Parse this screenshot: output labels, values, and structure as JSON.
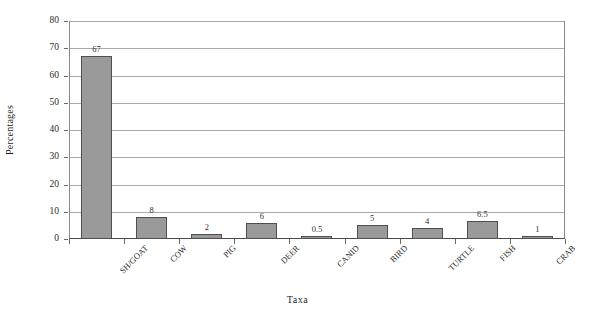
{
  "chart_data": {
    "type": "bar",
    "title": "",
    "xlabel": "Taxa",
    "ylabel": "Percentages",
    "categories": [
      "SH/GOAT",
      "COW",
      "PIG",
      "DEER",
      "CANID",
      "BIRD",
      "TURTLE",
      "FISH",
      "CRAB"
    ],
    "values": [
      67,
      8,
      2,
      6,
      0.5,
      5,
      4,
      6.5,
      1
    ],
    "value_labels": [
      "67",
      "8",
      "2",
      "6",
      "0.5",
      "5",
      "4",
      "6.5",
      "1"
    ],
    "ylim": [
      0,
      80
    ],
    "ytick_labels": [
      "0",
      "10",
      "20",
      "30",
      "40",
      "50",
      "60",
      "70",
      "80"
    ],
    "ytick_values": [
      0,
      10,
      20,
      30,
      40,
      50,
      60,
      70,
      80
    ],
    "grid": true,
    "legend": "none",
    "bar_color": "#9a9a9a",
    "bar_border_color": "#4f4f4f",
    "gridline_color": "#a9a9a9",
    "axis_color": "#4a4a4a",
    "background_color": "#ffffff"
  }
}
